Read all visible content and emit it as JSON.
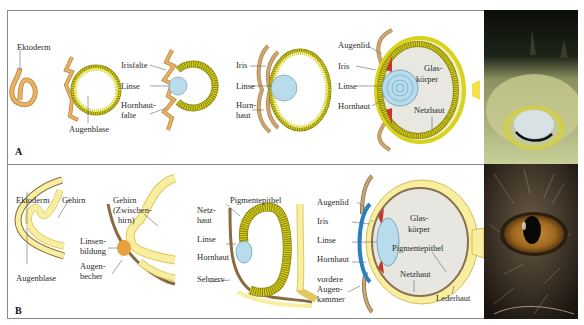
{
  "panels": [
    {
      "letter": "A",
      "stages": [
        {
          "labels": [
            "Ektoderm"
          ]
        },
        {
          "labels": [
            "Augenblase"
          ]
        },
        {
          "labels": [
            "Irisfalte",
            "Linse",
            "Hornhaut-",
            "falte"
          ]
        },
        {
          "labels": [
            "Iris",
            "Linse",
            "Horn-",
            "haut"
          ]
        },
        {
          "labels": [
            "Augenlid",
            "Iris",
            "Linse",
            "Hornhaut",
            "Glas-",
            "körper",
            "Netzhaut"
          ]
        }
      ],
      "photo": {
        "subject": "fish-eye-photo"
      }
    },
    {
      "letter": "B",
      "stages": [
        {
          "labels": [
            "Ektoderm",
            "Gehirn",
            "Augenblase"
          ]
        },
        {
          "labels": [
            "Gehirn",
            "(Zwischen-",
            "hirn)",
            "Linsen-",
            "bildung",
            "Augen-",
            "becher"
          ]
        },
        {
          "labels": [
            "Netz-",
            "haut",
            "Pigmentepithel",
            "Linse",
            "Hornhaut",
            "Sehnerv"
          ]
        },
        {
          "labels": [
            "Augenlid",
            "Iris",
            "Linse",
            "Hornhaut",
            "vordere",
            "Augen-",
            "kammer",
            "Glas-",
            "körper",
            "Pigmentepithel",
            "Netzhaut",
            "Lederhaut"
          ]
        }
      ],
      "photo": {
        "subject": "cat-eye-photo"
      }
    }
  ],
  "colors": {
    "ectoderm": "#e9b062",
    "retina": "#d8d21a",
    "lens": "#b9dcec",
    "iris": "#c0392b",
    "cornea_blue": "#2a7fc0",
    "brain": "#f7eea0",
    "skin": "#c9a57a",
    "border": "#8a8a8a"
  }
}
